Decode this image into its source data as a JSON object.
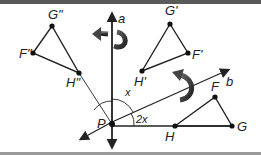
{
  "diagram": {
    "colors": {
      "line": "#222222",
      "arrow_fill": "#444444",
      "border": "#5a5a5a"
    },
    "axes": [
      {
        "name": "a",
        "label": "a"
      },
      {
        "name": "b",
        "label": "b"
      }
    ],
    "point_P": {
      "label": "P"
    },
    "angles": {
      "between_a_and_b": "x",
      "rotation_angle": "2x"
    },
    "triangles": {
      "original": {
        "vertices": [
          "F",
          "G",
          "H"
        ]
      },
      "image1": {
        "vertices": [
          "F'",
          "G'",
          "H'"
        ]
      },
      "image2": {
        "vertices": [
          "F\"",
          "G\"",
          "H\""
        ]
      }
    },
    "icons": [
      "curved-reflection-arrow-a",
      "curved-reflection-arrow-b"
    ]
  }
}
